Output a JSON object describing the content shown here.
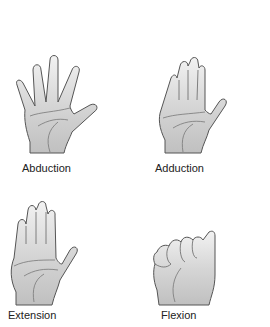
{
  "figure": {
    "panels": [
      {
        "id": "abduction",
        "label": "Abduction"
      },
      {
        "id": "adduction",
        "label": "Adduction"
      },
      {
        "id": "extension",
        "label": "Extension"
      },
      {
        "id": "flexion",
        "label": "Flexion"
      }
    ]
  },
  "colors": {
    "hand_fill_light": "#e8e8e8",
    "hand_fill_dark": "#c4c4c4",
    "outline": "#555555",
    "text": "#222222"
  }
}
